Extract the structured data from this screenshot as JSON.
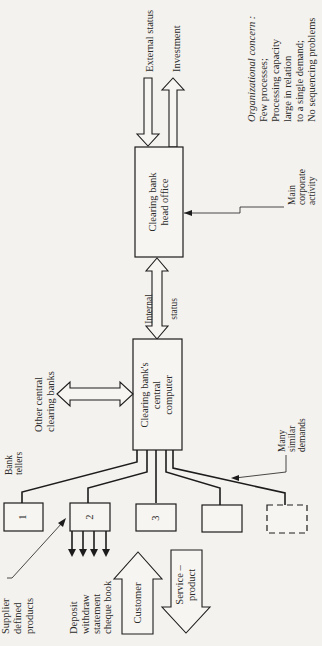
{
  "diagram": {
    "orientation": "rotated 90deg counter-clockwise",
    "nodes": {
      "head_office": {
        "label_line1": "Clearing bank",
        "label_line2": "head office"
      },
      "central_computer": {
        "label_line1": "Clearing bank's",
        "label_line2": "central",
        "label_line3": "computer"
      },
      "tellers": [
        {
          "label": "1"
        },
        {
          "label": "2"
        },
        {
          "label": "3"
        },
        {
          "label": ""
        },
        {
          "label": "",
          "style": "dashed"
        }
      ]
    },
    "arrows": {
      "external_status": "External status",
      "investment": "Investment",
      "internal_status_line1": "Internal",
      "internal_status_line2": "status",
      "other_banks_line1": "Other central",
      "other_banks_line2": "clearing banks",
      "customer": "Customer",
      "service_line1": "Service –",
      "service_line2": "product"
    },
    "annotations": {
      "main_activity_line1": "Main",
      "main_activity_line2": "corporate",
      "main_activity_line3": "activity",
      "bank_tellers_line1": "Bank",
      "bank_tellers_line2": "tellers",
      "many_demands_line1": "Many",
      "many_demands_line2": "similar",
      "many_demands_line3": "demands",
      "supplier_line1": "Supplier",
      "supplier_line2": "defined",
      "supplier_line3": "products",
      "products_line1": "Deposit",
      "products_line2": "withdraw",
      "products_line3": "statement",
      "products_line4": "cheque book"
    },
    "concern": {
      "title": "Organizational concern :",
      "line1": "Few processes;",
      "line2": "Processing capacity",
      "line3": "large in relation",
      "line4": "to a single demand;",
      "line5": "No sequencing problems"
    }
  }
}
